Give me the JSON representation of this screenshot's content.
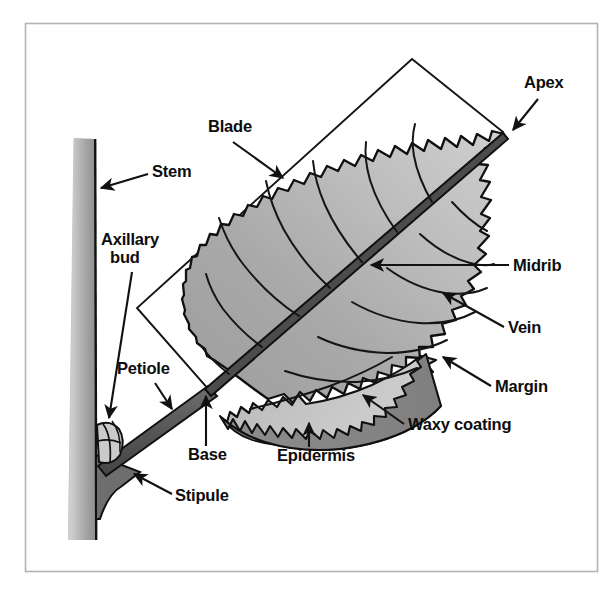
{
  "diagram": {
    "frame": {
      "border_color": "#b3b3b3",
      "background": "#ffffff"
    },
    "colors": {
      "outline": "#101010",
      "blade_upper": "#a6a6a6",
      "blade_lower": "#c4c4c4",
      "blade_light": "#cdcdcd",
      "waxy_coating": "#8a8a8a",
      "epidermis": "#b8b8b8",
      "stem_light": "#cfcfcf",
      "stem_mid": "#a9a9a9",
      "stem_dark": "#8f8f8f",
      "petiole": "#5d5d5d",
      "stipule": "#6b6b6b",
      "bud": "#c9c9c9",
      "label_text": "#0d0d0d"
    },
    "labels": [
      {
        "id": "apex",
        "text": "Apex",
        "x": 524,
        "y": 88,
        "anchor": "start"
      },
      {
        "id": "blade",
        "text": "Blade",
        "x": 208,
        "y": 132,
        "anchor": "start"
      },
      {
        "id": "stem",
        "text": "Stem",
        "x": 152,
        "y": 177,
        "anchor": "start"
      },
      {
        "id": "axillary-bud-1",
        "text": "Axillary",
        "x": 101,
        "y": 245,
        "anchor": "start"
      },
      {
        "id": "axillary-bud-2",
        "text": "bud",
        "x": 110,
        "y": 263,
        "anchor": "start"
      },
      {
        "id": "midrib",
        "text": "Midrib",
        "x": 513,
        "y": 271,
        "anchor": "start"
      },
      {
        "id": "vein",
        "text": "Vein",
        "x": 508,
        "y": 333,
        "anchor": "start"
      },
      {
        "id": "petiole",
        "text": "Petiole",
        "x": 117,
        "y": 374,
        "anchor": "start"
      },
      {
        "id": "margin",
        "text": "Margin",
        "x": 495,
        "y": 392,
        "anchor": "start"
      },
      {
        "id": "waxy-coating",
        "text": "Waxy coating",
        "x": 408,
        "y": 430,
        "anchor": "start"
      },
      {
        "id": "base",
        "text": "Base",
        "x": 188,
        "y": 460,
        "anchor": "start"
      },
      {
        "id": "epidermis",
        "text": "Epidermis",
        "x": 277,
        "y": 461,
        "anchor": "start"
      },
      {
        "id": "stipule",
        "text": "Stipule",
        "x": 175,
        "y": 501,
        "anchor": "start"
      }
    ]
  }
}
